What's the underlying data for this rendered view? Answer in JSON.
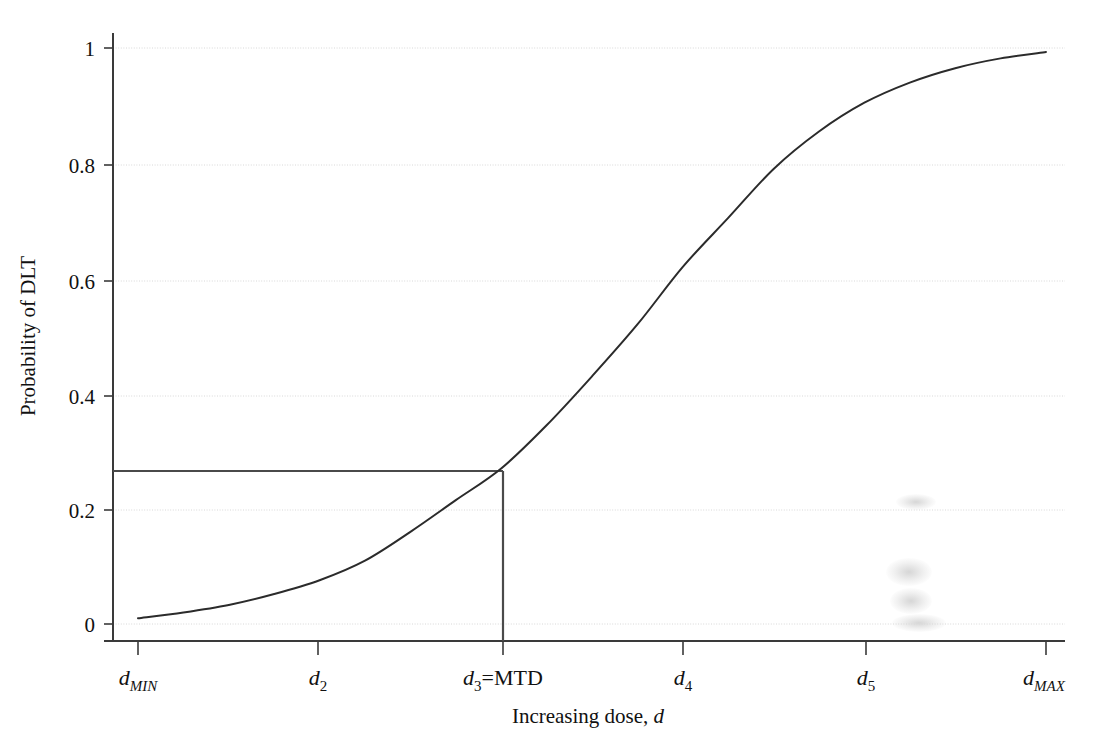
{
  "chart_data": {
    "type": "line",
    "title": "",
    "xlabel": "Increasing dose, d",
    "xlabel_parts": {
      "text": "Increasing dose, ",
      "var": "d"
    },
    "ylabel": "Probability of DLT",
    "ylim": [
      0,
      1
    ],
    "xlim": [
      0,
      1
    ],
    "grid": true,
    "grid_axis": "y",
    "legend": "none",
    "y_ticks": [
      "0",
      "0.2",
      "0.4",
      "0.6",
      "0.8",
      "1"
    ],
    "y_tick_values": [
      0,
      0.2,
      0.4,
      0.6,
      0.8,
      1
    ],
    "x_ticks": [
      {
        "base": "d",
        "sub": "MIN",
        "sub_italic": true,
        "suffix": ""
      },
      {
        "base": "d",
        "sub": "2",
        "sub_italic": false,
        "suffix": ""
      },
      {
        "base": "d",
        "sub": "3",
        "sub_italic": false,
        "suffix": "=MTD"
      },
      {
        "base": "d",
        "sub": "4",
        "sub_italic": false,
        "suffix": ""
      },
      {
        "base": "d",
        "sub": "5",
        "sub_italic": false,
        "suffix": ""
      },
      {
        "base": "d",
        "sub": "MAX",
        "sub_italic": true,
        "suffix": ""
      }
    ],
    "x_tick_labels": [
      "dMIN",
      "d2",
      "d3=MTD",
      "d4",
      "d5",
      "dMAX"
    ],
    "x_tick_positions": [
      0.0,
      0.2,
      0.4,
      0.6,
      0.8,
      1.0
    ],
    "series": [
      {
        "name": "Dose-toxicity curve",
        "points_x": [
          0.0,
          0.05,
          0.1,
          0.15,
          0.2,
          0.25,
          0.3,
          0.35,
          0.4,
          0.45,
          0.5,
          0.55,
          0.6,
          0.65,
          0.7,
          0.75,
          0.8,
          0.85,
          0.9,
          0.95,
          1.0
        ],
        "points_y": [
          0.01,
          0.02,
          0.033,
          0.052,
          0.076,
          0.11,
          0.16,
          0.215,
          0.27,
          0.345,
          0.43,
          0.52,
          0.62,
          0.705,
          0.79,
          0.855,
          0.905,
          0.94,
          0.965,
          0.982,
          0.993
        ]
      }
    ],
    "annotations": [
      {
        "name": "mtd-reference-lines",
        "kind": "crosshair",
        "x": 0.4,
        "y": 0.27,
        "label": "d3=MTD",
        "target_toxicity": 0.27
      }
    ]
  },
  "axes": {
    "y_axis_label": "Probability of DLT",
    "x_axis_label_text": "Increasing dose, ",
    "x_axis_label_var": "d"
  },
  "artifacts": {
    "smudge_note": "scan smudge"
  },
  "colors": {
    "background": "#ffffff",
    "axis": "#3a3a3a",
    "curve": "#2b2b2b",
    "gridline": "#d8d8d8",
    "reference_line": "#4a4a4a",
    "text": "#111111"
  }
}
